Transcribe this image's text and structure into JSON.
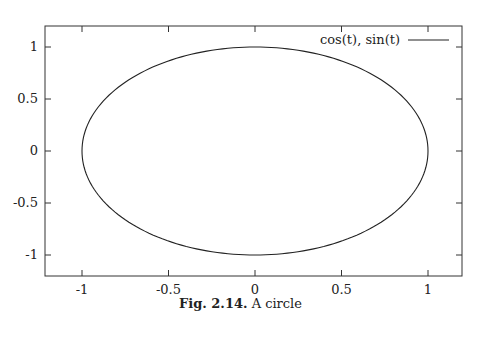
{
  "chart_data": {
    "type": "line",
    "title": "",
    "xlabel": "",
    "ylabel": "",
    "xlim": [
      -1.2,
      1.2
    ],
    "ylim": [
      -1.2,
      1.2
    ],
    "grid": false,
    "legend_position": "top-right",
    "xticks": [
      "-1",
      "-0.5",
      "0",
      "0.5",
      "1"
    ],
    "yticks": [
      "1",
      "0.5",
      "0",
      "-0.5",
      "-1"
    ],
    "series": [
      {
        "name": "cos(t), sin(t)",
        "parametric": "x=cos(t), y=sin(t), t in [0, 2pi]",
        "x": [
          1,
          0.7071,
          0,
          -0.7071,
          -1,
          -0.7071,
          0,
          0.7071,
          1
        ],
        "y": [
          0,
          0.7071,
          1,
          0.7071,
          0,
          -0.7071,
          -1,
          -0.7071,
          0
        ]
      }
    ]
  },
  "legend": {
    "label": "cos(t), sin(t)"
  },
  "caption": {
    "prefix": "Fig. 2.14.",
    "text": "A circle"
  }
}
